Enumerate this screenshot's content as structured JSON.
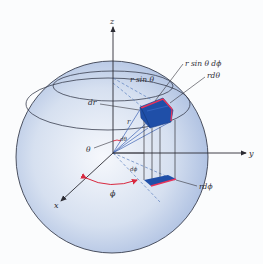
{
  "diagram": {
    "axes": {
      "x": "x",
      "y": "y",
      "z": "z"
    },
    "labels": {
      "r_sin_theta_dphi": "r sin θ dϕ",
      "r_sin_theta": "r sin θ",
      "r_dtheta": "rdθ",
      "dr": "dr",
      "r": "r",
      "theta": "θ",
      "dtheta": "dθ",
      "dphi": "dϕ",
      "phi": "ϕ",
      "r_dphi": "rdϕ"
    },
    "colors": {
      "sphere_light": "#f4f7fc",
      "sphere_dark": "#a9bde0",
      "box_fill": "#1f4fa8",
      "box_edge": "#e8335a",
      "arc": "#d8283f",
      "guide_dashed": "#5a7fbf",
      "lines": "#33333a"
    }
  }
}
